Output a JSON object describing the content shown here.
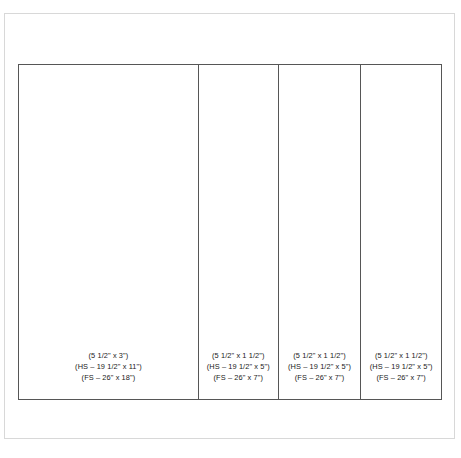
{
  "drawing": {
    "type": "panel-elevation-layout",
    "panel_count": 4,
    "outline_color": "#565656",
    "background_color": "#ffffff",
    "text_color": "#1a1a1a",
    "panels": [
      {
        "id": "panel-1",
        "width_ratio": 0.424,
        "lines": [
          "(5 1/2\" x 3\")",
          "(HS – 19 1/2\" x 11\")",
          "(FS – 26\" x 18\")"
        ],
        "nominal_size": "(5 1/2\" x 3\")",
        "hs_size": "(HS – 19 1/2\" x 11\")",
        "fs_size": "(FS – 26\" x 18\")"
      },
      {
        "id": "panel-2",
        "width_ratio": 0.189,
        "lines": [
          "(5 1/2\" x 1 1/2\")",
          "(HS – 19 1/2\" x 5\")",
          "(FS – 26\" x 7\")"
        ],
        "nominal_size": "(5 1/2\" x 1 1/2\")",
        "hs_size": "(HS – 19 1/2\" x 5\")",
        "fs_size": "(FS – 26\" x 7\")"
      },
      {
        "id": "panel-3",
        "width_ratio": 0.196,
        "lines": [
          "(5 1/2\" x 1 1/2\")",
          "(HS – 19 1/2\" x 5\")",
          "(FS – 26\" x 7\")"
        ],
        "nominal_size": "(5 1/2\" x 1 1/2\")",
        "hs_size": "(HS – 19 1/2\" x 5\")",
        "fs_size": "(FS – 26\" x 7\")"
      },
      {
        "id": "panel-4",
        "width_ratio": 0.191,
        "lines": [
          "(5 1/2\" x 1 1/2\")",
          "(HS – 19 1/2\" x 5\")",
          "(FS – 26\" x 7\")"
        ],
        "nominal_size": "(5 1/2\" x 1 1/2\")",
        "hs_size": "(HS – 19 1/2\" x 5\")",
        "fs_size": "(FS – 26\" x 7\")"
      }
    ]
  }
}
